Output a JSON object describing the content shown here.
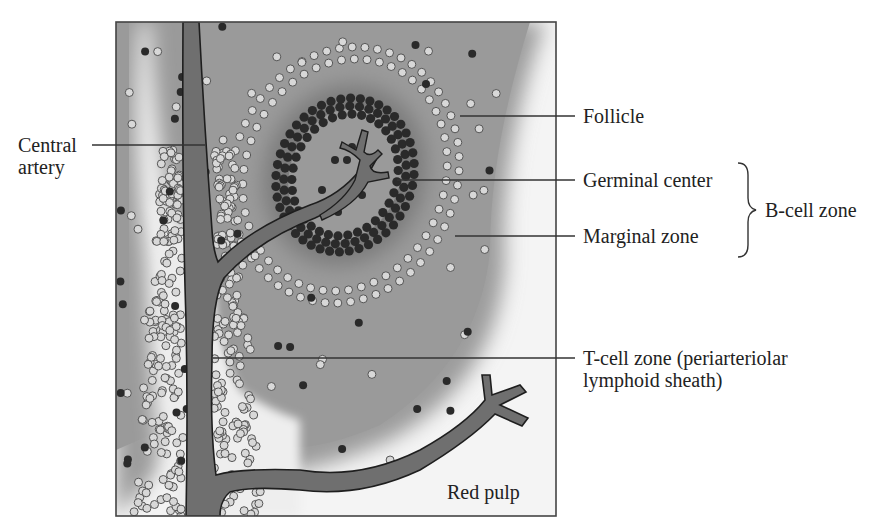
{
  "figure": {
    "labels": {
      "central_artery_line1": "Central",
      "central_artery_line2": "artery",
      "follicle": "Follicle",
      "germinal_center": "Germinal center",
      "marginal_zone": "Marginal zone",
      "b_cell_zone": "B-cell zone",
      "t_cell_zone_line1": "T-cell zone (periarteriolar",
      "t_cell_zone_line2": "lymphoid sheath)",
      "red_pulp": "Red pulp"
    },
    "colors": {
      "frame": "#444444",
      "tissue_gray": "#9a9a9a",
      "pale_region": "#f2f2f2",
      "artery_fill": "#6e6e6e",
      "dark_cell": "#2b2b2b",
      "light_cell": "#d6d6d6",
      "leader_line": "#333333"
    }
  }
}
